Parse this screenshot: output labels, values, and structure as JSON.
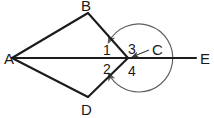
{
  "figure": {
    "background_color": "#ffffff",
    "stroke_color": "#1c1c1c",
    "arc_color": "#5f5f5f",
    "width": 214,
    "height": 118
  },
  "vertices": [
    {
      "id": "A",
      "label": "A",
      "x": 12,
      "y": 58,
      "label_x": 4,
      "label_y": 64
    },
    {
      "id": "B",
      "label": "B",
      "x": 88,
      "y": 13,
      "label_x": 81,
      "label_y": 10
    },
    {
      "id": "C",
      "label": "C",
      "x": 128,
      "y": 58,
      "label_x": 152,
      "label_y": 54
    },
    {
      "id": "D",
      "label": "D",
      "x": 88,
      "y": 97,
      "label_x": 81,
      "label_y": 114
    },
    {
      "id": "E",
      "label": "E",
      "x": 196,
      "y": 58,
      "label_x": 201,
      "label_y": 64
    }
  ],
  "angle_labels": [
    {
      "id": "1",
      "label": "1",
      "x": 103,
      "y": 54
    },
    {
      "id": "2",
      "label": "2",
      "x": 103,
      "y": 73
    },
    {
      "id": "3",
      "label": "3",
      "x": 128,
      "y": 53
    },
    {
      "id": "4",
      "label": "4",
      "x": 128,
      "y": 75
    }
  ],
  "segments": [
    {
      "id": "AB",
      "from": "A",
      "to": "B"
    },
    {
      "id": "BC",
      "from": "B",
      "to": "C"
    },
    {
      "id": "CD",
      "from": "C",
      "to": "D"
    },
    {
      "id": "DA",
      "from": "D",
      "to": "A"
    }
  ],
  "axis": {
    "id": "AE",
    "from": "A",
    "to": "E",
    "x1": 12,
    "y1": 58,
    "x2": 196,
    "y2": 58
  },
  "circle": {
    "id": "arc-circle",
    "center_x": 139,
    "center_y": 58,
    "radius": 34,
    "arrow_top": "arrowhead pointing down-left onto segment BC",
    "arrow_bottom": "arrowhead pointing up-left onto segment CD"
  },
  "leader": {
    "id": "c-leader",
    "from_x": 148,
    "from_y": 51,
    "to_x": 132,
    "to_y": 57
  }
}
